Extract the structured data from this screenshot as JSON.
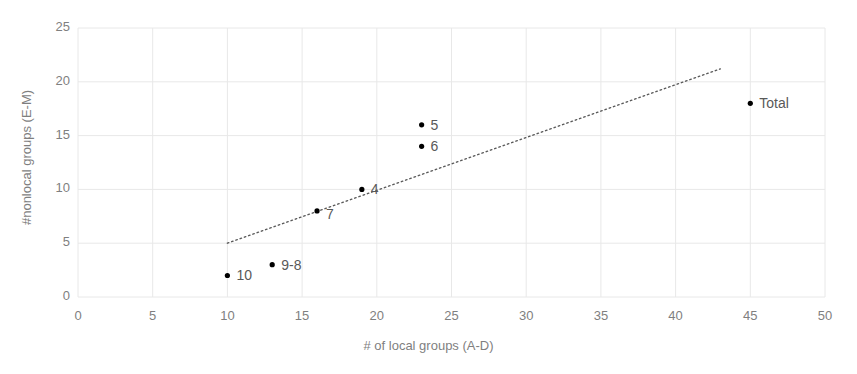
{
  "chart_data": {
    "type": "scatter",
    "title": "",
    "xlabel": "# of local groups (A-D)",
    "ylabel": "#nonlocal groups (E-M)",
    "xlim": [
      0,
      50
    ],
    "ylim": [
      0,
      25
    ],
    "x_ticks": [
      "0",
      "5",
      "10",
      "15",
      "20",
      "25",
      "30",
      "35",
      "40",
      "45",
      "50"
    ],
    "y_ticks": [
      "0",
      "5",
      "10",
      "15",
      "20",
      "25"
    ],
    "grid": true,
    "legend": "none",
    "marker_color": "#000000",
    "label_color": "#595959",
    "axis_color": "#7f7f7f",
    "grid_color": "#e8e8e8",
    "trendline_color": "#595959",
    "points": [
      {
        "label": "10",
        "x": 10,
        "y": 2,
        "label_dx": 9,
        "label_dy": -8
      },
      {
        "label": "9-8",
        "x": 13,
        "y": 3,
        "label_dx": 9,
        "label_dy": -8
      },
      {
        "label": "7",
        "x": 16,
        "y": 8,
        "label_dx": 9,
        "label_dy": -5
      },
      {
        "label": "4",
        "x": 19,
        "y": 10,
        "label_dx": 9,
        "label_dy": -8
      },
      {
        "label": "6",
        "x": 23,
        "y": 14,
        "label_dx": 9,
        "label_dy": -8
      },
      {
        "label": "5",
        "x": 23,
        "y": 16,
        "label_dx": 9,
        "label_dy": -8
      },
      {
        "label": "Total",
        "x": 45,
        "y": 18,
        "label_dx": 9,
        "label_dy": -8
      }
    ],
    "trendline": {
      "style": "dotted",
      "x0": 10,
      "y0": 5.0,
      "x1": 43,
      "y1": 21.2
    }
  }
}
